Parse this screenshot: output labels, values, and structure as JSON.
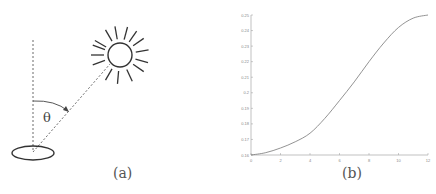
{
  "panel_a": {
    "caption": "(a)",
    "angle_label": "θ",
    "elements": [
      "sun",
      "vertical-zenith-line",
      "sun-ray-dashed-line",
      "angle-arc",
      "ground-ellipse"
    ]
  },
  "panel_b": {
    "caption": "(b)"
  },
  "chart_data": {
    "type": "line",
    "title": "",
    "xlabel": "",
    "ylabel": "",
    "xlim": [
      0,
      12
    ],
    "ylim": [
      0.16,
      0.25
    ],
    "x_ticks": [
      "0",
      "2",
      "4",
      "6",
      "8",
      "10",
      "12"
    ],
    "y_ticks": [
      "0.16",
      "0.17",
      "0.18",
      "0.19",
      "0.2",
      "0.21",
      "0.22",
      "0.23",
      "0.24",
      "0.25"
    ],
    "grid": false,
    "series": [
      {
        "name": "curve",
        "x": [
          0,
          1,
          2,
          3,
          4,
          5,
          6,
          7,
          8,
          9,
          10,
          11,
          12
        ],
        "y": [
          0.16,
          0.1615,
          0.1645,
          0.1685,
          0.174,
          0.1835,
          0.195,
          0.207,
          0.22,
          0.232,
          0.242,
          0.248,
          0.25
        ]
      }
    ]
  }
}
